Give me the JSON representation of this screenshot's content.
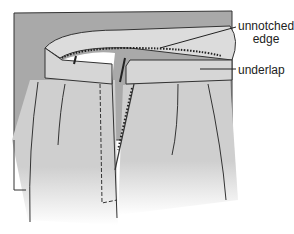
{
  "figure": {
    "colors": {
      "background_panel": "#a8a8a8",
      "fabric": "#d2d2d2",
      "band": "#dcdcdc",
      "line": "#333333",
      "interior": "#ffffff"
    }
  },
  "labels": {
    "unnotched_line1": "unnotched",
    "unnotched_line2": "edge",
    "underlap": "underlap"
  }
}
